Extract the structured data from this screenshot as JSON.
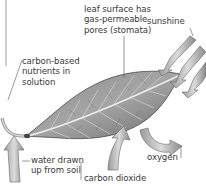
{
  "diagram": {
    "labels": {
      "leaf_surface": "leaf surface has\ngas-permeable\npores (stomata)",
      "sunshine": "sunshine",
      "nutrients": "carbon-based\nnutrients in\nsolution",
      "water": "water drawn\nup from soil",
      "oxygen": "oxygen",
      "carbon_dioxide": "carbon dioxide"
    },
    "colors": {
      "leaf_fill": "#9a9a9a",
      "leaf_dark": "#5e5e5e",
      "vein": "#e8e8e8",
      "arrow_fill": "#b8b8b8",
      "leader_line": "#555555",
      "text": "#3a3a3a"
    }
  }
}
